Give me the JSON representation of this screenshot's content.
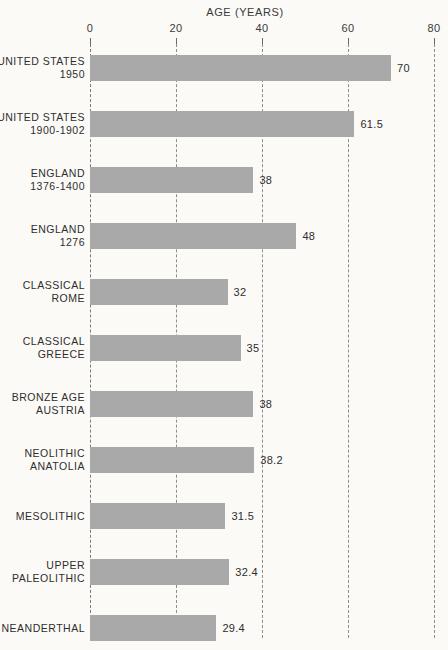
{
  "chart_data": {
    "type": "bar",
    "orientation": "horizontal",
    "title": "AGE (YEARS)",
    "xlabel": "AGE (YEARS)",
    "ylabel": "",
    "xlim": [
      0,
      80
    ],
    "xticks": [
      "0",
      "20",
      "40",
      "60",
      "80"
    ],
    "xtick_values": [
      0,
      20,
      40,
      60,
      80
    ],
    "grid": true,
    "grid_style": "dashed-vertical",
    "legend": "none",
    "bar_color": "#a9a9a9",
    "background_color": "#fbfaf7",
    "categories": [
      "UNITED STATES 1950",
      "UNITED STATES 1900-1902",
      "ENGLAND 1376-1400",
      "ENGLAND 1276",
      "CLASSICAL ROME",
      "CLASSICAL GREECE",
      "BRONZE AGE AUSTRIA",
      "NEOLITHIC ANATOLIA",
      "MESOLITHIC",
      "UPPER PALEOLITHIC",
      "NEANDERTHAL"
    ],
    "values": [
      70,
      61.5,
      38,
      48,
      32,
      35,
      38,
      38.2,
      31.5,
      32.4,
      29.4
    ],
    "value_labels": [
      "70",
      "61.5",
      "38",
      "48",
      "32",
      "35",
      "38",
      "38.2",
      "31.5",
      "32.4",
      "29.4"
    ],
    "bars": [
      {
        "line1": "UNITED STATES",
        "line2": "1950",
        "value": 70,
        "label": "70"
      },
      {
        "line1": "UNITED STATES",
        "line2": "1900-1902",
        "value": 61.5,
        "label": "61.5"
      },
      {
        "line1": "ENGLAND",
        "line2": "1376-1400",
        "value": 38,
        "label": "38"
      },
      {
        "line1": "ENGLAND",
        "line2": "1276",
        "value": 48,
        "label": "48"
      },
      {
        "line1": "CLASSICAL",
        "line2": "ROME",
        "value": 32,
        "label": "32"
      },
      {
        "line1": "CLASSICAL",
        "line2": "GREECE",
        "value": 35,
        "label": "35"
      },
      {
        "line1": "BRONZE AGE",
        "line2": "AUSTRIA",
        "value": 38,
        "label": "38"
      },
      {
        "line1": "NEOLITHIC",
        "line2": "ANATOLIA",
        "value": 38.2,
        "label": "38.2"
      },
      {
        "line1": "MESOLITHIC",
        "line2": "",
        "value": 31.5,
        "label": "31.5"
      },
      {
        "line1": "UPPER",
        "line2": "PALEOLITHIC",
        "value": 32.4,
        "label": "32.4"
      },
      {
        "line1": "NEANDERTHAL",
        "line2": "",
        "value": 29.4,
        "label": "29.4"
      }
    ]
  }
}
